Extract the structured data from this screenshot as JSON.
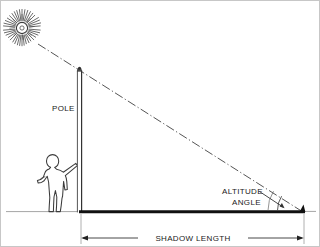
{
  "figure": {
    "type": "technical-line-diagram",
    "background_color": "#ffffff",
    "ink_color": "#1a1a1a",
    "frame": {
      "visible": true,
      "color": "#c9c9c9",
      "width_px": 320,
      "height_px": 247
    }
  },
  "labels": {
    "pole": "POLE",
    "altitude_line1": "ALTITUDE",
    "altitude_line2": "ANGLE",
    "shadow_length": "SHADOW LENGTH"
  },
  "elements": {
    "sun": {
      "name": "sun",
      "center_x": 22,
      "center_y": 28,
      "core_radius": 5.5,
      "ray_count": 40,
      "ray_inner": 7,
      "ray_outer": 19,
      "color": "#3a3a3a"
    },
    "sun_ray": {
      "name": "sun-ray-dash-dot",
      "from_x": 38,
      "from_y": 44,
      "to_x": 303,
      "to_y": 212,
      "style": "dash-dot",
      "color": "#555555"
    },
    "pole": {
      "name": "vertical-pole",
      "x_left": 77,
      "x_right": 82,
      "top_y": 68,
      "base_y": 213,
      "height_px": 145,
      "color": "#2a2a2a"
    },
    "ground_line": {
      "name": "ground-line-left",
      "from_x": 6,
      "to_x": 77,
      "y": 212,
      "color": "#9a9a9a",
      "thickness": 1
    },
    "shadow_line": {
      "name": "shadow-on-ground",
      "from_x": 79,
      "to_x": 305,
      "y": 212,
      "color": "#111111",
      "thickness": 3
    },
    "ground_line_right": {
      "name": "ground-line-right",
      "from_x": 305,
      "to_x": 315,
      "y": 212,
      "color": "#9a9a9a",
      "thickness": 1
    },
    "angle_arc": {
      "name": "altitude-angle-arc",
      "vertex_x": 303,
      "vertex_y": 212,
      "radius": 26,
      "start_deg": 180,
      "end_deg": 212,
      "color": "#444444"
    },
    "leader": {
      "name": "angle-leader-arrow",
      "from_x": 259,
      "from_y": 192,
      "to_x": 284,
      "to_y": 208
    },
    "person": {
      "name": "person-silhouette",
      "outline_color": "#3c3c3c",
      "fill": "#ffffff",
      "head_top_y": 155,
      "feet_y": 212,
      "x_left": 33,
      "x_right": 77
    },
    "dimension": {
      "name": "shadow-length-dimension",
      "y": 238,
      "from_x": 81,
      "to_x": 304,
      "ext_top_y": 214,
      "color": "#333333"
    }
  },
  "measurements": {
    "pole_height_px": 145,
    "shadow_length_px": 224,
    "altitude_angle_deg": 33
  }
}
